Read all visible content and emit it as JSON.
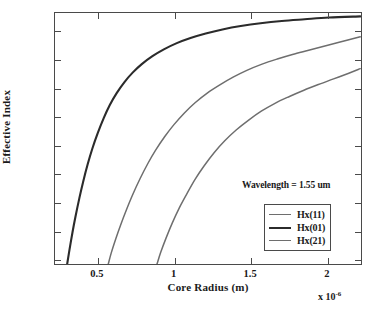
{
  "chart_data": {
    "type": "line",
    "title": "",
    "xlabel": "Core Radius (m)",
    "ylabel": "Effective Index",
    "x_multiplier": "x 10",
    "x_multiplier_exponent": "-6",
    "xlim": [
      0.22,
      2.23
    ],
    "ylim": [
      0.99,
      1.432
    ],
    "xticks": [
      0.5,
      1,
      1.5,
      2
    ],
    "xtick_labels": [
      "0.5",
      "1",
      "1.5",
      "2"
    ],
    "yticks": [
      1,
      1.05,
      1.1,
      1.15,
      1.2,
      1.25,
      1.3,
      1.35,
      1.4
    ],
    "ytick_labels": [
      "1",
      "1.05",
      "1.1",
      "1.15",
      "1.2",
      "1.25",
      "1.3",
      "1.35",
      "1.4"
    ],
    "grid": false,
    "legend_position": "lower-right",
    "annotations": [
      {
        "text": "Wavelength = 1.55 um",
        "x": 1.35,
        "y": 1.18
      }
    ],
    "series": [
      {
        "name": "Hx(11)",
        "color": "#6e6e6e",
        "width": 1.5,
        "points": [
          [
            0.57,
            0.99
          ],
          [
            0.59,
            1.01
          ],
          [
            0.62,
            1.035
          ],
          [
            0.65,
            1.058
          ],
          [
            0.69,
            1.086
          ],
          [
            0.73,
            1.112
          ],
          [
            0.78,
            1.141
          ],
          [
            0.83,
            1.167
          ],
          [
            0.88,
            1.19
          ],
          [
            0.94,
            1.214
          ],
          [
            1.0,
            1.235
          ],
          [
            1.07,
            1.256
          ],
          [
            1.14,
            1.274
          ],
          [
            1.22,
            1.291
          ],
          [
            1.3,
            1.305
          ],
          [
            1.39,
            1.319
          ],
          [
            1.48,
            1.331
          ],
          [
            1.58,
            1.342
          ],
          [
            1.68,
            1.351
          ],
          [
            1.78,
            1.359
          ],
          [
            1.88,
            1.366
          ],
          [
            1.98,
            1.373
          ],
          [
            2.08,
            1.38
          ],
          [
            2.225,
            1.39
          ]
        ]
      },
      {
        "name": "Hx(01)",
        "color": "#2b2b2b",
        "width": 2.1,
        "points": [
          [
            0.3,
            0.99
          ],
          [
            0.315,
            1.015
          ],
          [
            0.335,
            1.046
          ],
          [
            0.355,
            1.074
          ],
          [
            0.38,
            1.106
          ],
          [
            0.405,
            1.135
          ],
          [
            0.435,
            1.166
          ],
          [
            0.465,
            1.193
          ],
          [
            0.5,
            1.22
          ],
          [
            0.54,
            1.247
          ],
          [
            0.58,
            1.27
          ],
          [
            0.625,
            1.291
          ],
          [
            0.675,
            1.31
          ],
          [
            0.73,
            1.327
          ],
          [
            0.79,
            1.342
          ],
          [
            0.86,
            1.356
          ],
          [
            0.935,
            1.368
          ],
          [
            1.02,
            1.379
          ],
          [
            1.11,
            1.388
          ],
          [
            1.21,
            1.396
          ],
          [
            1.32,
            1.403
          ],
          [
            1.44,
            1.409
          ],
          [
            1.57,
            1.414
          ],
          [
            1.71,
            1.418
          ],
          [
            1.86,
            1.421
          ],
          [
            2.02,
            1.424
          ],
          [
            2.225,
            1.426
          ]
        ]
      },
      {
        "name": "Hx(21)",
        "color": "#6e6e6e",
        "width": 1.5,
        "points": [
          [
            0.89,
            0.99
          ],
          [
            0.915,
            1.011
          ],
          [
            0.95,
            1.036
          ],
          [
            0.99,
            1.062
          ],
          [
            1.035,
            1.088
          ],
          [
            1.085,
            1.113
          ],
          [
            1.14,
            1.139
          ],
          [
            1.2,
            1.163
          ],
          [
            1.265,
            1.186
          ],
          [
            1.335,
            1.207
          ],
          [
            1.41,
            1.226
          ],
          [
            1.49,
            1.243
          ],
          [
            1.575,
            1.259
          ],
          [
            1.665,
            1.273
          ],
          [
            1.76,
            1.285
          ],
          [
            1.855,
            1.296
          ],
          [
            1.95,
            1.306
          ],
          [
            2.05,
            1.316
          ],
          [
            2.15,
            1.326
          ],
          [
            2.225,
            1.334
          ]
        ]
      }
    ]
  },
  "legend": {
    "items": [
      {
        "label": "Hx(11)",
        "color": "#6e6e6e",
        "width": 1.5
      },
      {
        "label": "Hx(01)",
        "color": "#2b2b2b",
        "width": 2.2
      },
      {
        "label": "Hx(21)",
        "color": "#6e6e6e",
        "width": 1.5
      }
    ]
  },
  "axis_color": "#4a4a4a"
}
